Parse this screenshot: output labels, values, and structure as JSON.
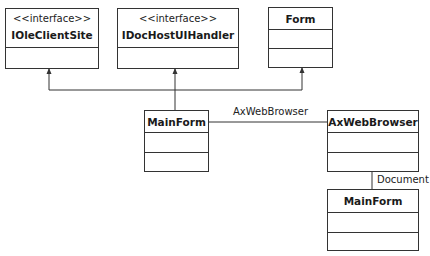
{
  "classes": {
    "ioleclientsite": {
      "stereotype": "<<interface>>",
      "name": "IOleClientSite"
    },
    "idochostuihandler": {
      "stereotype": "<<interface>>",
      "name": "IDocHostUIHandler"
    },
    "form": {
      "name": "Form"
    },
    "mainform": {
      "name": "MainForm"
    },
    "axwebbrowser": {
      "name": "AxWebBrowser"
    },
    "mainform_document": {
      "name": "MainForm"
    }
  },
  "associations": {
    "mainform_axwebbrowser": {
      "label": "AxWebBrowser"
    },
    "axwebbrowser_document": {
      "label": "Document"
    }
  },
  "colors": {
    "line": "#333333",
    "background": "#ffffff"
  }
}
